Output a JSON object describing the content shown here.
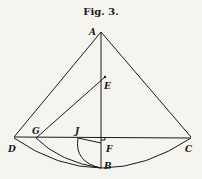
{
  "figure": {
    "title": "Fig. 3.",
    "labels": {
      "A": "A",
      "B": "B",
      "C": "C",
      "D": "D",
      "E": "E",
      "F": "F",
      "G": "G",
      "J": "J"
    },
    "colors": {
      "ink": "#1a1a1a",
      "paper": "#f6f4ef"
    }
  }
}
